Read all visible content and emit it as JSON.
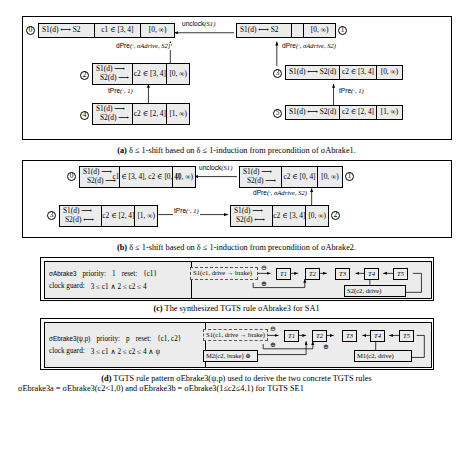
{
  "figure": {
    "panels": [
      {
        "id": "a",
        "caption_prefix": "(a)",
        "caption": "δ ≤ 1-shift based on δ ≤ 1-induction from precondition of σAbrake1."
      },
      {
        "id": "b",
        "caption_prefix": "(b)",
        "caption": "δ ≤ 1-shift based on δ ≤ 1-induction from precondition of σAbrake2."
      },
      {
        "id": "c",
        "caption_prefix": "(c)",
        "caption": "The synthesized TGTS rule σAbrake3 for SA1"
      },
      {
        "id": "d",
        "caption_prefix": "(d)",
        "caption_line1": "TGTS rule pattern σEbrake3(ψ,p) used to derive the two concrete TGTS rules",
        "caption_line2": "σEbrake3a = σEbrake3(c2<1,0) and σEbrake3b = σEbrake3(1≤c2≤4,1) for TGTS SE1"
      }
    ]
  },
  "panel_a": {
    "nodes": [
      {
        "index": "0",
        "graph_line1": "S1(d) ⟷ S2",
        "graph_line2": "",
        "clock": "c1 ∈ [3, 4]",
        "interval": "[0, ∞)"
      },
      {
        "index": "1",
        "graph_line1": "S1(d) ⟷ S2",
        "graph_line2": "",
        "clock": "",
        "interval": "[0, ∞)"
      },
      {
        "index": "2",
        "graph_line1": "S1(d) ⟶",
        "graph_line2": "S2(d) ⟶",
        "clock": "c2 ∈ [3, 4]",
        "interval": "[0, ∞)"
      },
      {
        "index": "3",
        "graph_line1": "S1(d) ⟷ S2(d)",
        "graph_line2": "",
        "clock": "c2 ∈ [3, 4]",
        "interval": "[0, ∞)"
      },
      {
        "index": "4",
        "graph_line1": "S1(d) ⟶",
        "graph_line2": "S2(d) ⟶",
        "clock": "c2 ∈ [2, 4]",
        "interval": "[1, ∞)"
      },
      {
        "index": "5",
        "graph_line1": "S1(d) ⟷ S2(d)",
        "graph_line2": "",
        "clock": "c2 ∈ [2, 4]",
        "interval": "[1, ∞)"
      }
    ],
    "edges": [
      {
        "label_main": "unclock",
        "label_args": "(S1)"
      },
      {
        "label_main": "dPre",
        "label_args": "(·, σAdrive, S2)"
      },
      {
        "label_main": "dPre",
        "label_args": "(·, σAdrive, S2)"
      },
      {
        "label_main": "tPre",
        "label_args": "(·, 1)"
      },
      {
        "label_main": "tPre",
        "label_args": "(·, 1)"
      }
    ]
  },
  "panel_b": {
    "nodes": [
      {
        "index": "0",
        "graph_line1": "S1(d) ⟶",
        "graph_line2": "S2(d) ⟶",
        "clock": "c1 ∈ [3, 4], c2 ∈ [0, 4]",
        "interval": "[0, ∞)"
      },
      {
        "index": "1",
        "graph_line1": "S1(d) ⟶",
        "graph_line2": "S2(d) ⟶",
        "clock": "c2 ∈ [0, 4]",
        "interval": "[0, ∞)"
      },
      {
        "index": "3",
        "graph_line1": "S1(d) ⟶",
        "graph_line2": "S2(d) ⟷",
        "clock": "c2 ∈ [2, 4]",
        "interval": "[1, ∞)"
      },
      {
        "index": "2",
        "graph_line1": "S1(d) ⟶",
        "graph_line2": "S2(d) ⟷",
        "clock": "c2 ∈ [3, 4]",
        "interval": "[0, ∞)"
      }
    ],
    "edges": [
      {
        "label_main": "unclock",
        "label_args": "(S1)"
      },
      {
        "label_main": "dPre",
        "label_args": "(·, σAdrive, S2)"
      },
      {
        "label_main": "tPre",
        "label_args": "(·, 1)"
      }
    ]
  },
  "panel_c": {
    "rule_name": "σAbrake3",
    "priority_label": "priority:",
    "priority_value": "1",
    "reset_label": "reset:",
    "reset_value": "{c1}",
    "clock_guard_label": "clock guard:",
    "clock_guard_value": "3 ≤ c1 ∧ 2 ≤ c2 ≤ 4",
    "lhs_node": "S1(c1, drive → brake)",
    "bottom_node": "S2(c2, drive)",
    "trains": [
      "T1",
      "T2",
      "T3",
      "T4",
      "T5"
    ],
    "ominus": "⊖",
    "oplus": "⊕"
  },
  "panel_d": {
    "rule_name": "σEbrake3(ψ,p)",
    "priority_label": "priority:",
    "priority_value": "p",
    "reset_label": "reset:",
    "reset_value": "{c1, c2}",
    "clock_guard_label": "clock guard:",
    "clock_guard_value": "3 ≤ c1 ∧ 2 ≤ c2 ≤ 4 ∧ ψ",
    "lhs_node": "S1(c1, drive → brake)",
    "lhs_node2": "M2(c2, brake) ⊕",
    "bottom_node": "M1(c2, drive)",
    "trains": [
      "T1",
      "T2",
      "T3",
      "T4",
      "T5"
    ],
    "ominus": "⊖",
    "oplus": "⊕"
  }
}
